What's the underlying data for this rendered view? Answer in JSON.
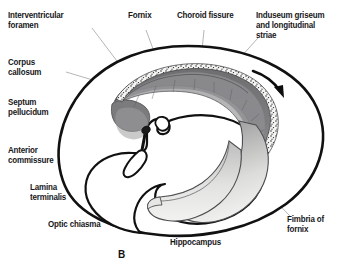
{
  "figure": {
    "caption": "B"
  },
  "labels": [
    {
      "id": "interventricular-foramen",
      "text": "Interventricular\nforamen",
      "x": 8,
      "y": 10,
      "align": "left"
    },
    {
      "id": "corpus-callosum",
      "text": "Corpus\ncallosum",
      "x": 8,
      "y": 57,
      "align": "left"
    },
    {
      "id": "septum-pellucidum",
      "text": "Septum\npellucidum",
      "x": 8,
      "y": 97,
      "align": "left"
    },
    {
      "id": "anterior-commissure",
      "text": "Anterior\ncommissure",
      "x": 8,
      "y": 145,
      "align": "left"
    },
    {
      "id": "lamina-terminalis",
      "text": "Lamina\nterminalis",
      "x": 30,
      "y": 182,
      "align": "left"
    },
    {
      "id": "optic-chiasma",
      "text": "Optic chiasma",
      "x": 48,
      "y": 219,
      "align": "left"
    },
    {
      "id": "fornix",
      "text": "Fornix",
      "x": 128,
      "y": 10,
      "align": "left"
    },
    {
      "id": "choroid-fissure",
      "text": "Choroid fissure",
      "x": 177,
      "y": 10,
      "align": "left"
    },
    {
      "id": "induseum-griseum",
      "text": "Induseum griseum\nand longitudinal\nstriae",
      "x": 256,
      "y": 10,
      "align": "left"
    },
    {
      "id": "hippocampus",
      "text": "Hippocampus",
      "x": 170,
      "y": 237,
      "align": "left"
    },
    {
      "id": "fimbria-of-fornix",
      "text": "Fimbria of\nfornix",
      "x": 287,
      "y": 214,
      "align": "left"
    }
  ],
  "colors": {
    "outline": "#111111",
    "leader": "#8e8e92",
    "band_dark": "#6f6f72",
    "band_mid": "#8f8f92",
    "band_light": "#b9b9bb",
    "fimbria_light": "#d8d8d6",
    "stipple": "#2b2b2e",
    "text": "#17171a",
    "background": "#ffffff"
  },
  "annotations": {
    "arrow": "curved-arrow-clockwise"
  }
}
